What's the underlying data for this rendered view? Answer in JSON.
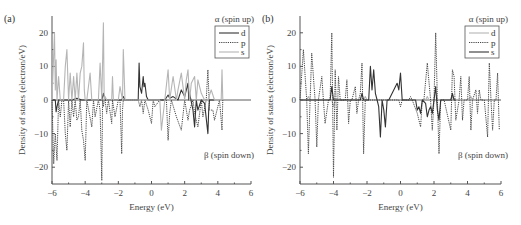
{
  "chart_data": [
    {
      "type": "line",
      "panel_label": "(a)",
      "xlabel": "Energy (eV)",
      "ylabel": "Density of states (electron/eV)",
      "xlim": [
        -6,
        6
      ],
      "ylim": [
        -25,
        25
      ],
      "xticks": [
        -6,
        -4,
        -2,
        0,
        2,
        4,
        6
      ],
      "yticks": [
        -20,
        -10,
        0,
        10,
        20
      ],
      "annotations": {
        "top": "α (spin up)",
        "bottom": "β (spin down)"
      },
      "legend": {
        "position": "upper right",
        "entries": [
          "d",
          "p",
          "s"
        ]
      },
      "series": [
        {
          "name": "d",
          "style": "solid",
          "color": "#333333",
          "x": [
            -6,
            -5.8,
            -5.75,
            -5.7,
            -5.6,
            -5.5,
            -4.8,
            -4.5,
            -4.2,
            -3.0,
            -2.9,
            -2.8,
            -1.8,
            -1.7,
            -1.6,
            -0.8,
            -0.75,
            -0.7,
            -0.6,
            -0.5,
            -0.45,
            -0.4,
            -0.3,
            -0.2,
            0.1,
            0.8,
            1.0,
            1.1,
            1.3,
            1.6,
            1.8,
            1.9,
            2.0,
            2.2,
            2.25,
            2.3,
            2.5,
            2.6,
            2.7,
            2.8,
            3.0,
            3.2,
            3.4,
            3.45,
            3.5,
            3.8
          ],
          "y": [
            0,
            0,
            -3.5,
            -2,
            0,
            0,
            0,
            0.5,
            0,
            0,
            2,
            0,
            0,
            1,
            0,
            0,
            11,
            4,
            2,
            7,
            4,
            5,
            1,
            0,
            0,
            0,
            1.5,
            0.5,
            1,
            0,
            3,
            2,
            1,
            5,
            0,
            2,
            -3,
            -8,
            0,
            -3,
            0,
            -1,
            -10,
            -3,
            0,
            0
          ]
        },
        {
          "name": "p",
          "style": "dotted",
          "color": "#444444",
          "x": [
            -6,
            -5.9,
            -5.8,
            -5.7,
            -5.6,
            -5.5,
            -5.4,
            -5.3,
            -5.2,
            -5.1,
            -5.0,
            -4.9,
            -4.8,
            -4.7,
            -4.6,
            -4.5,
            -4.4,
            -4.3,
            -4.2,
            -4.1,
            -4.0,
            -3.9,
            -3.6,
            -3.5,
            -3.4,
            -3.2,
            -3.1,
            -3.0,
            -2.95,
            -2.9,
            -2.85,
            -2.8,
            -2.7,
            -2.6,
            -2.4,
            -2.35,
            -2.2,
            -2.0,
            -1.9,
            -1.8,
            -1.75,
            -1.7,
            -0.8,
            -0.7,
            -0.6,
            -0.5,
            -0.4,
            -0.2,
            0,
            0.1,
            0.2,
            0.5,
            0.9,
            1.0,
            1.1,
            1.2,
            1.5,
            1.8,
            2.0,
            2.2,
            2.3,
            2.5,
            2.6,
            2.8,
            3.0,
            3.1,
            3.3,
            3.4,
            3.5,
            3.7,
            3.8,
            4.1,
            4.2,
            4.25,
            4.3
          ],
          "y": [
            0,
            -19,
            -10,
            -18,
            0,
            -5,
            0,
            0,
            -10,
            -15,
            0,
            -8,
            0,
            -5,
            0,
            -6,
            -5,
            0,
            -9,
            -12,
            -18,
            0,
            -8,
            0,
            -5,
            0,
            -3,
            -24,
            0,
            -2,
            0,
            0,
            -4,
            0,
            -7,
            0,
            -5,
            0,
            0,
            -16,
            -3,
            0,
            0,
            -2,
            0,
            -4,
            0,
            -3,
            -7,
            0,
            -2,
            0,
            0,
            -12,
            -4,
            0,
            -5,
            -9,
            0,
            -6,
            -3,
            0,
            -4,
            -8,
            0,
            -5,
            0,
            9,
            -3,
            -3,
            -6,
            0,
            -6,
            -9,
            0
          ]
        },
        {
          "name": "s",
          "style": "solid",
          "color": "#b5b5b5",
          "x": [
            -6,
            -5.85,
            -5.8,
            -5.75,
            -5.7,
            -5.6,
            -5.5,
            -5.4,
            -5.3,
            -5.2,
            -5.1,
            -5.0,
            -4.9,
            -4.8,
            -4.7,
            -4.6,
            -4.5,
            -4.4,
            -4.3,
            -4.2,
            -4.1,
            -4.05,
            -4.0,
            -3.9,
            -3.7,
            -3.6,
            -3.5,
            -3.2,
            -3.1,
            -3.0,
            -2.9,
            -2.85,
            -2.8,
            -2.7,
            -2.4,
            -2.35,
            -2.3,
            -2.0,
            -1.9,
            -1.75,
            -1.7,
            -1.6,
            -0.2,
            0,
            0.5,
            0.6,
            0.8,
            1.0,
            1.1,
            1.3,
            1.5,
            1.6,
            1.8,
            2.0,
            2.1,
            2.2,
            2.3,
            2.4,
            2.6,
            2.7,
            2.8,
            3.0,
            3.2,
            3.4,
            3.6,
            3.8,
            4.2,
            4.25,
            4.3
          ],
          "y": [
            0,
            20,
            3,
            12,
            0,
            7,
            0,
            0,
            0,
            10,
            15,
            0,
            8,
            0,
            7,
            0,
            8,
            0,
            8,
            10,
            17,
            3,
            0,
            0,
            8,
            0,
            0,
            0,
            11,
            0,
            23,
            0,
            1,
            0,
            0,
            7,
            0,
            0,
            4,
            0,
            15,
            0,
            0,
            0,
            0,
            -9,
            0,
            9,
            0,
            7,
            0,
            3,
            8,
            0,
            6,
            9,
            0,
            5,
            7,
            0,
            6,
            2,
            0,
            0,
            3,
            0,
            0,
            9,
            0
          ]
        }
      ]
    },
    {
      "type": "line",
      "panel_label": "(b)",
      "xlabel": "Energy (eV)",
      "ylabel": "Density of states (electron/eV)",
      "xlim": [
        -6,
        6
      ],
      "ylim": [
        -25,
        25
      ],
      "xticks": [
        -6,
        -4,
        -2,
        0,
        2,
        4,
        6
      ],
      "yticks": [
        -20,
        -10,
        0,
        10,
        20
      ],
      "annotations": {
        "top": "α (spin up)",
        "bottom": "β (spin down)"
      },
      "legend": {
        "position": "upper right",
        "entries": [
          "d",
          "p",
          "s"
        ]
      },
      "series": [
        {
          "name": "d",
          "style": "solid",
          "color": "#b5b5b5",
          "x": [
            -6,
            -5.6,
            -5.5,
            -5.4,
            -4.1,
            -4.0,
            -3.9,
            -3.8,
            -2.2,
            -2.1,
            -2.0,
            -1.5,
            -1.4,
            1.5,
            1.6,
            1.7,
            3.0,
            3.1,
            3.2,
            4.0,
            4.2,
            4.3
          ],
          "y": [
            0,
            0,
            1,
            0,
            0,
            -2,
            0,
            0,
            0,
            1,
            0,
            0,
            0,
            0,
            1,
            0,
            0,
            1,
            0,
            0,
            1,
            0
          ]
        },
        {
          "name": "p",
          "style": "dotted",
          "color": "#444444",
          "x": [
            -6,
            -5.8,
            -5.6,
            -5.5,
            -5.4,
            -5.3,
            -5.1,
            -5.0,
            -4.9,
            -4.7,
            -4.6,
            -4.5,
            -4.3,
            -4.2,
            -4.1,
            -4.0,
            -3.9,
            -3.8,
            -3.7,
            -3.6,
            -3.5,
            -3.3,
            -3.2,
            -3.1,
            -3.0,
            -2.9,
            -2.7,
            -2.6,
            -2.5,
            -2.4,
            -2.3,
            -2.2,
            -2.1,
            -2.0,
            -1.9,
            -1.6,
            -1.5,
            -1.4,
            -1.3,
            -1.0,
            -0.9,
            -0.6,
            -0.1,
            0,
            0.1,
            0.5,
            0.6,
            0.7,
            1.0,
            1.2,
            1.3,
            1.4,
            1.6,
            1.8,
            1.9,
            2.0,
            2.1,
            2.2,
            2.3,
            2.4,
            2.6,
            3.0,
            3.1,
            3.2,
            3.3,
            3.5,
            3.6,
            3.7,
            3.8,
            4.0,
            4.1,
            4.2,
            4.3,
            4.5,
            4.6,
            4.7,
            4.8,
            5.0,
            5.2,
            5.3,
            5.4,
            5.5,
            5.6,
            5.7,
            5.8,
            5.9
          ],
          "y": [
            0,
            15,
            0,
            -16,
            0,
            14,
            0,
            -14,
            0,
            7,
            0,
            -7,
            0,
            0,
            20,
            -23,
            9,
            -9,
            7,
            0,
            0,
            0,
            6,
            -7,
            0,
            0,
            4,
            -4,
            0,
            2,
            11,
            -16,
            0,
            0,
            0,
            0,
            0,
            0,
            0,
            0,
            0,
            0,
            0,
            -2,
            0,
            0,
            1,
            0,
            -4,
            -8,
            0,
            0,
            11,
            0,
            -9,
            0,
            20,
            0,
            -16,
            0,
            0,
            -9,
            9,
            7,
            -6,
            0,
            7,
            -6,
            0,
            0,
            7,
            -9,
            0,
            3,
            -4,
            3,
            0,
            0,
            -11,
            11,
            0,
            -9,
            0,
            0,
            8,
            -9
          ]
        },
        {
          "name": "s",
          "style": "solid",
          "color": "#333333",
          "x": [
            -6,
            -4.2,
            -4.1,
            -4.0,
            -3.9,
            -2.4,
            -2.3,
            -2.2,
            -2.1,
            -1.9,
            -1.8,
            -1.7,
            -1.6,
            -1.5,
            -1.4,
            -1.3,
            -1.2,
            -1.1,
            -1.0,
            -0.9,
            -0.8,
            -0.7,
            -0.2,
            -0.1,
            0,
            0.1,
            0.2,
            0.9,
            1.0,
            1.1,
            1.2,
            1.3,
            1.5,
            1.6,
            1.7,
            1.8,
            1.9,
            2.0,
            2.1,
            2.2,
            2.3,
            2.4,
            2.5,
            3.0,
            3.1,
            3.2,
            3.3
          ],
          "y": [
            0,
            0,
            4,
            0,
            0,
            0,
            2,
            0,
            0,
            0,
            10,
            3,
            9,
            2,
            0,
            -2,
            -11,
            0,
            -3,
            -8,
            0,
            0,
            5,
            3,
            8,
            0,
            0,
            0,
            -3,
            -2,
            -4,
            0,
            -1,
            -5,
            -3,
            -2,
            -4,
            0,
            4,
            -3,
            -6,
            0,
            0,
            0,
            2,
            0,
            0
          ]
        }
      ]
    }
  ]
}
